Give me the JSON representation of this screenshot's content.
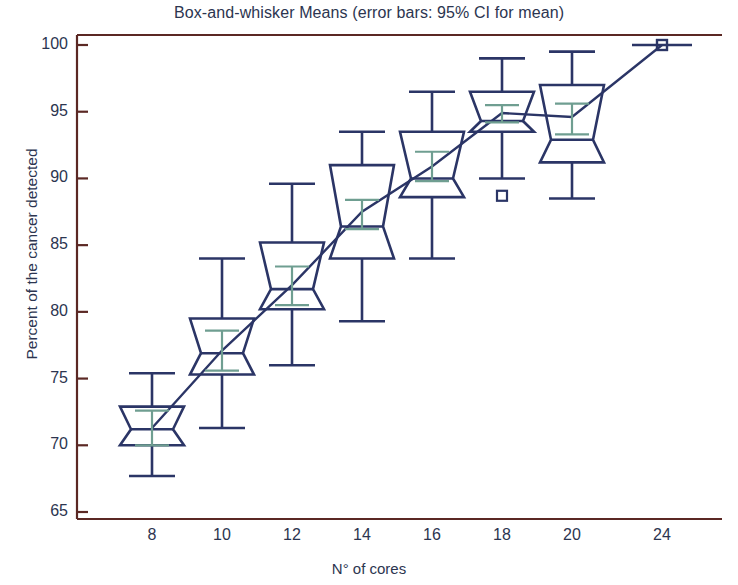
{
  "chart_data": {
    "type": "box",
    "title": "Box-and-whisker  Means  (error bars: 95% CI for mean)",
    "xlabel": "N° of cores",
    "ylabel": "Percent of the cancer detected",
    "categories": [
      "8",
      "10",
      "12",
      "14",
      "16",
      "18",
      "20",
      "24"
    ],
    "ylim": [
      63.5,
      101
    ],
    "yticks": [
      65,
      70,
      75,
      80,
      85,
      90,
      95,
      100
    ],
    "grid": false,
    "legend": "none",
    "colors": {
      "box": "#2b3566",
      "mean_error_bar": "#6f9e91",
      "axis_frame": "#5b2824",
      "text": "#2c3550",
      "background": "#ffffff"
    },
    "annotations": [
      "Connected line joins the mean of each group",
      "Boxes are notched at the median",
      "Teal error bars show the 95% CI for the mean"
    ],
    "boxes": [
      {
        "category": "8",
        "whisker_low": 67.7,
        "q1": 70.0,
        "median": 71.2,
        "q3": 72.9,
        "whisker_high": 75.4,
        "mean": 71.3,
        "ci_low": 70.0,
        "ci_high": 72.6,
        "outliers": []
      },
      {
        "category": "10",
        "whisker_low": 71.3,
        "q1": 75.3,
        "median": 76.9,
        "q3": 79.5,
        "whisker_high": 84.0,
        "mean": 77.1,
        "ci_low": 75.6,
        "ci_high": 78.6,
        "outliers": []
      },
      {
        "category": "12",
        "whisker_low": 76.0,
        "q1": 80.2,
        "median": 81.7,
        "q3": 85.2,
        "whisker_high": 89.6,
        "mean": 82.0,
        "ci_low": 80.5,
        "ci_high": 83.4,
        "outliers": []
      },
      {
        "category": "14",
        "whisker_low": 79.3,
        "q1": 84.0,
        "median": 86.4,
        "q3": 91.0,
        "whisker_high": 93.5,
        "mean": 87.5,
        "ci_low": 86.2,
        "ci_high": 88.4,
        "outliers": []
      },
      {
        "category": "16",
        "whisker_low": 84.0,
        "q1": 88.6,
        "median": 90.0,
        "q3": 93.5,
        "whisker_high": 96.5,
        "mean": 90.9,
        "ci_low": 89.8,
        "ci_high": 92.0,
        "outliers": []
      },
      {
        "category": "18",
        "whisker_low": 90.0,
        "q1": 93.5,
        "median": 94.3,
        "q3": 96.5,
        "whisker_high": 99.0,
        "mean": 94.9,
        "ci_low": 94.2,
        "ci_high": 95.5,
        "outliers": [
          88.7
        ]
      },
      {
        "category": "20",
        "whisker_low": 88.5,
        "q1": 91.2,
        "median": 92.9,
        "q3": 97.0,
        "whisker_high": 99.5,
        "mean": 94.6,
        "ci_low": 93.3,
        "ci_high": 95.6,
        "outliers": []
      },
      {
        "category": "24",
        "whisker_low": 100.0,
        "q1": 100.0,
        "median": 100.0,
        "q3": 100.0,
        "whisker_high": 100.0,
        "mean": 100.0,
        "ci_low": 100.0,
        "ci_high": 100.0,
        "outliers": [
          100.0
        ]
      }
    ],
    "mean_line": {
      "name": "Means",
      "x": [
        "8",
        "10",
        "12",
        "14",
        "16",
        "18",
        "20",
        "24"
      ],
      "values": [
        71.3,
        77.1,
        82.0,
        87.5,
        90.9,
        94.9,
        94.6,
        100.0
      ]
    }
  }
}
